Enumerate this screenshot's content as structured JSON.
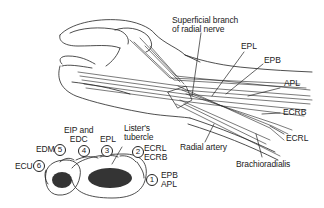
{
  "figure": {
    "hand_labels": [
      {
        "id": "superficial-branch",
        "text_line1": "Superficial branch",
        "text_line2": "of radial nerve"
      },
      {
        "id": "epl",
        "text": "EPL"
      },
      {
        "id": "epb",
        "text": "EPB"
      },
      {
        "id": "apl",
        "text": "APL"
      },
      {
        "id": "ecrb",
        "text": "ECRB"
      },
      {
        "id": "ecrl",
        "text": "ECRL"
      },
      {
        "id": "radial-artery",
        "text": "Radial artery"
      },
      {
        "id": "brachioradialis",
        "text": "Brachioradialis"
      }
    ],
    "cross_section": {
      "compartments": [
        {
          "number": "1",
          "line1": "EPB",
          "line2": "APL"
        },
        {
          "number": "2",
          "line1": "ECRL",
          "line2": "ECRB"
        },
        {
          "number": "3",
          "line1": "EPL"
        },
        {
          "number": "4",
          "line1": "EIP and",
          "line2": "EDC"
        },
        {
          "number": "5",
          "line1": "EDM"
        },
        {
          "number": "6",
          "line1": "ECU"
        }
      ],
      "landmark_line1": "Lister's",
      "landmark_line2": "tubercle"
    },
    "colors": {
      "ink": "#222222",
      "background": "#ffffff"
    }
  }
}
